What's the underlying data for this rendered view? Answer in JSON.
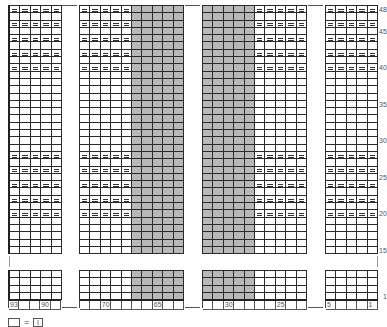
{
  "chart": {
    "title": "",
    "row_labels_top": [
      {
        "label": "48",
        "row": 0
      },
      {
        "label": "45",
        "row": 3
      },
      {
        "label": "40",
        "row": 8
      },
      {
        "label": "35",
        "row": 13
      },
      {
        "label": "30",
        "row": 18
      },
      {
        "label": "25",
        "row": 23
      },
      {
        "label": "20",
        "row": 28
      },
      {
        "label": "15",
        "row": 33
      }
    ],
    "row_labels_bottom": [
      {
        "label": "1",
        "row": 3
      }
    ],
    "column_labels": {
      "block_a": [
        "93",
        "",
        "",
        "90",
        ""
      ],
      "block_b": [
        "",
        "",
        "70",
        "",
        "",
        "",
        "",
        "65",
        "",
        ""
      ],
      "block_c": [
        "",
        "",
        "30",
        "",
        "",
        "",
        "",
        "25",
        "",
        ""
      ],
      "block_d": [
        "5",
        "",
        "",
        "",
        "1"
      ]
    },
    "purl_rows_top": [
      0,
      2,
      4,
      6,
      8,
      20,
      22,
      24,
      26,
      28
    ],
    "shading": {
      "block_b_gray_cols": [
        5,
        6,
        7,
        8,
        9
      ],
      "block_c_gray_cols": [
        0,
        1,
        2,
        3,
        4
      ]
    },
    "colors": {
      "grid_line": "#2a2a2a",
      "shade": "#b8b8b8",
      "label": "#555555"
    }
  },
  "legend": {
    "equals": "=",
    "symbol_text": "I",
    "description": "blank square = knit stitch (I)"
  }
}
